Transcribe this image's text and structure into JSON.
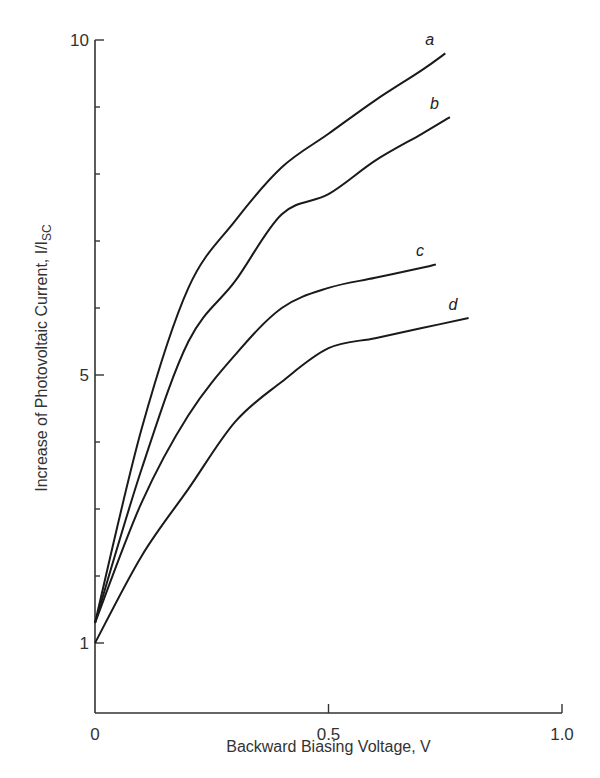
{
  "chart_data": {
    "type": "line",
    "title": "",
    "xlabel": "Backward Biasing Voltage, V",
    "ylabel": "Increase of Photovoltaic Current, I/I",
    "ylabel_subscript": "SC",
    "xlim": [
      0,
      1.0
    ],
    "ylim": [
      0,
      10
    ],
    "x_ticks": [
      0,
      0.5,
      1.0
    ],
    "x_tick_labels": [
      "0",
      "0.5",
      "1.0"
    ],
    "y_ticks": [
      1,
      2,
      3,
      4,
      5,
      6,
      7,
      8,
      9,
      10
    ],
    "y_tick_labels": [
      "1",
      "",
      "",
      "",
      "5",
      "",
      "",
      "",
      "",
      "10"
    ],
    "grid": false,
    "legend": "inline labels at curve ends",
    "series": [
      {
        "name": "a",
        "x": [
          0,
          0.1,
          0.2,
          0.3,
          0.4,
          0.5,
          0.6,
          0.7,
          0.75
        ],
        "values": [
          1.3,
          4.2,
          6.3,
          7.3,
          8.1,
          8.6,
          9.1,
          9.55,
          9.8
        ]
      },
      {
        "name": "b",
        "x": [
          0,
          0.1,
          0.2,
          0.3,
          0.4,
          0.5,
          0.6,
          0.7,
          0.76
        ],
        "values": [
          1.3,
          3.6,
          5.5,
          6.4,
          7.4,
          7.7,
          8.2,
          8.6,
          8.85
        ]
      },
      {
        "name": "c",
        "x": [
          0,
          0.1,
          0.2,
          0.3,
          0.4,
          0.5,
          0.6,
          0.7,
          0.73
        ],
        "values": [
          1.3,
          3.1,
          4.4,
          5.3,
          6.0,
          6.3,
          6.45,
          6.6,
          6.65
        ]
      },
      {
        "name": "d",
        "x": [
          0,
          0.1,
          0.2,
          0.3,
          0.4,
          0.5,
          0.6,
          0.7,
          0.8
        ],
        "values": [
          1.0,
          2.3,
          3.3,
          4.3,
          4.9,
          5.4,
          5.55,
          5.7,
          5.85
        ]
      }
    ]
  }
}
